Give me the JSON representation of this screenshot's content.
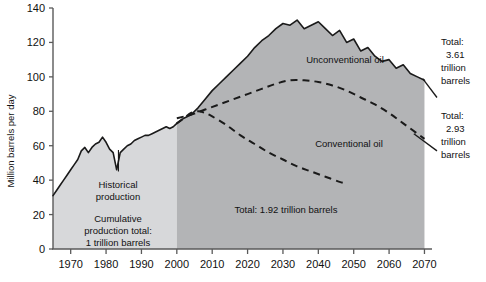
{
  "chart_data": {
    "type": "area",
    "title": "",
    "xlabel": "",
    "ylabel": "Million barrels per day",
    "xlim": [
      1965,
      2071
    ],
    "ylim": [
      0,
      140
    ],
    "grid": false,
    "legend_position": "inline-annotations",
    "xticks": [
      "1970",
      "1980",
      "1990",
      "2000",
      "2010",
      "2020",
      "2030",
      "2040",
      "2050",
      "2060",
      "2070"
    ],
    "xtick_values": [
      1970,
      1980,
      1990,
      2000,
      2010,
      2020,
      2030,
      2040,
      2050,
      2060,
      2070
    ],
    "yticks": [
      "0",
      "20",
      "40",
      "60",
      "80",
      "100",
      "120",
      "140"
    ],
    "ytick_values": [
      0,
      20,
      40,
      60,
      80,
      100,
      120,
      140
    ],
    "series": [
      {
        "name": "Historical production",
        "style": "solid-line-filled-light",
        "x": [
          1965,
          1966,
          1967,
          1968,
          1969,
          1970,
          1971,
          1972,
          1973,
          1974,
          1975,
          1976,
          1977,
          1978,
          1979,
          1980,
          1981,
          1982,
          1983,
          1984,
          1985,
          1986,
          1987,
          1988,
          1989,
          1990,
          1991,
          1992,
          1993,
          1994,
          1995,
          1996,
          1997,
          1998,
          1999,
          2000
        ],
        "values": [
          31,
          34,
          37,
          40,
          43,
          46,
          49,
          52,
          57,
          59,
          56,
          59,
          61,
          62,
          65,
          62,
          58,
          56,
          46,
          56,
          58,
          60,
          61,
          63,
          64,
          65,
          66,
          66,
          67,
          68,
          69,
          70,
          71,
          70,
          71,
          73
        ]
      },
      {
        "name": "Total production (Conventional + Unconventional oil)",
        "style": "solid-line-filled-dark",
        "x": [
          2000,
          2002,
          2004,
          2006,
          2008,
          2010,
          2012,
          2014,
          2016,
          2018,
          2020,
          2022,
          2024,
          2026,
          2028,
          2030,
          2032,
          2034,
          2036,
          2038,
          2040,
          2042,
          2044,
          2046,
          2048,
          2050,
          2052,
          2054,
          2056,
          2058,
          2060,
          2062,
          2064,
          2066,
          2068,
          2070
        ],
        "values": [
          73,
          76,
          78,
          82,
          87,
          92,
          96,
          100,
          104,
          108,
          112,
          117,
          121,
          124,
          128,
          131,
          130,
          133,
          128,
          130,
          132,
          128,
          124,
          127,
          120,
          122,
          115,
          117,
          112,
          109,
          110,
          105,
          107,
          102,
          100,
          98
        ]
      },
      {
        "name": "Conventional oil upper boundary",
        "style": "dashed",
        "x": [
          2000,
          2004,
          2008,
          2012,
          2016,
          2020,
          2024,
          2028,
          2032,
          2036,
          2040,
          2044,
          2048,
          2052,
          2056,
          2060,
          2064,
          2068,
          2070
        ],
        "values": [
          76,
          78,
          81,
          84,
          87,
          90,
          93,
          96,
          98,
          98,
          97,
          95,
          92,
          88,
          84,
          79,
          73,
          67,
          64
        ]
      },
      {
        "name": "Conventional oil decline",
        "style": "dashed",
        "x": [
          2000,
          2002,
          2004,
          2006,
          2008,
          2010,
          2014,
          2018,
          2022,
          2026,
          2030,
          2034,
          2038,
          2042,
          2046,
          2048
        ],
        "values": [
          73,
          76,
          79,
          80,
          79,
          77,
          72,
          66,
          61,
          56,
          52,
          48,
          45,
          42,
          39,
          38
        ]
      }
    ],
    "annotations": [
      {
        "name": "historical-production",
        "text": "Historical\nproduction",
        "x": 1984,
        "y": 38
      },
      {
        "name": "cumulative-production-total",
        "text": "Cumulative\nproduction total:\n1 trillion barrels",
        "x": 1984,
        "y": 20
      },
      {
        "name": "unconventional-oil",
        "text": "Unconventional oil",
        "x": 2032,
        "y": 111
      },
      {
        "name": "conventional-oil",
        "text": "Conventional oil",
        "x": 2041,
        "y": 76
      },
      {
        "name": "total-conventional",
        "text": "Total: 1.92 trillion barrels",
        "x": 2031,
        "y": 29
      },
      {
        "name": "total-upper-right",
        "text": "Total:\n3.61\ntrillion\nbarrels",
        "x": 2073,
        "y": 105
      },
      {
        "name": "total-lower-right",
        "text": "Total:\n2.93\ntrillion\nbarrels",
        "x": 2073,
        "y": 66
      }
    ]
  },
  "labels": {
    "y_axis": "Million barrels per day",
    "historical_production_l1": "Historical",
    "historical_production_l2": "production",
    "cumulative_l1": "Cumulative",
    "cumulative_l2": "production total:",
    "cumulative_l3": "1 trillion barrels",
    "unconventional_oil": "Unconventional oil",
    "conventional_oil": "Conventional oil",
    "total_conventional": "Total: 1.92 trillion barrels",
    "total_a_l1": "Total:",
    "total_a_l2": "3.61",
    "total_a_l3": "trillion",
    "total_a_l4": "barrels",
    "total_b_l1": "Total:",
    "total_b_l2": "2.93",
    "total_b_l3": "trillion",
    "total_b_l4": "barrels"
  },
  "ticks": {
    "y": [
      "140",
      "120",
      "100",
      "80",
      "60",
      "40",
      "20",
      "0"
    ],
    "x": [
      "1970",
      "1980",
      "1990",
      "2000",
      "2010",
      "2020",
      "2030",
      "2040",
      "2050",
      "2060",
      "2070"
    ]
  },
  "colors": {
    "historical_fill": "#d7d8da",
    "future_fill": "#b3b4b6",
    "line": "#1a1a1a",
    "text": "#111111",
    "axis": "#5a5a5a"
  }
}
